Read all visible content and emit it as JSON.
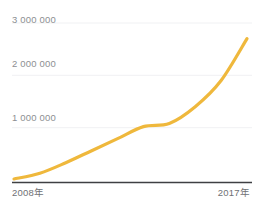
{
  "chart_data": {
    "type": "line",
    "title": "",
    "subtitle": "",
    "xlabel": "",
    "ylabel": "",
    "grid": true,
    "legend": "none",
    "x": [
      2008,
      2009,
      2010,
      2011,
      2012,
      2013,
      2014,
      2015,
      2016,
      2017
    ],
    "categories": [
      "2008年",
      "2009年",
      "2010年",
      "2011年",
      "2012年",
      "2013年",
      "2014年",
      "2015年",
      "2016年",
      "2017年"
    ],
    "series": [
      {
        "name": "累計数",
        "color": "#efb83c",
        "values": [
          20000,
          130000,
          330000,
          560000,
          790000,
          1020000,
          1080000,
          1400000,
          1900000,
          2700000
        ]
      }
    ],
    "xlim": [
      2008,
      2017
    ],
    "ylim": [
      0,
      3200000
    ],
    "yticks": [
      1000000,
      2000000,
      3000000
    ],
    "ytick_labels": [
      "1 000 000",
      "2 000 000",
      "3 000 000"
    ],
    "xticks": [
      2008,
      2017
    ],
    "xtick_labels": [
      "2008年",
      "2017年"
    ],
    "axis_color": "#3f4043",
    "gridline_color": "#f0f1f3",
    "background_color": "#ffffff",
    "tick_label_color": "#8d8f92"
  },
  "axes": {
    "y_labels": {
      "three_million": "3 000 000",
      "two_million": "2 000 000",
      "one_million": "1 000 000"
    },
    "x_labels": {
      "start": "2008年",
      "end": "2017年"
    }
  }
}
